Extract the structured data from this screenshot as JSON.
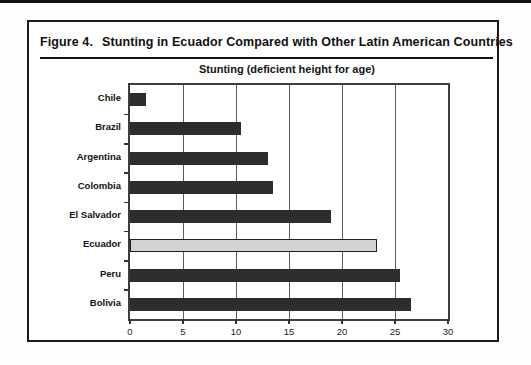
{
  "figure": {
    "title_prefix": "Figure 4.",
    "title": "Stunting in Ecuador Compared with Other Latin American Countries"
  },
  "chart_data": {
    "type": "bar",
    "orientation": "horizontal",
    "title": "Stunting (deficient height for age)",
    "categories": [
      "Chile",
      "Brazil",
      "Argentina",
      "Colombia",
      "El Salvador",
      "Ecuador",
      "Peru",
      "Bolivia"
    ],
    "values": [
      1.5,
      10.5,
      13,
      13.5,
      19,
      23.3,
      25.5,
      26.5
    ],
    "highlight_category": "Ecuador",
    "highlight_index": 5,
    "xlim": [
      0,
      30
    ],
    "x_ticks": [
      0,
      5,
      10,
      15,
      20,
      25,
      30
    ],
    "gridlines_at": [
      5,
      10,
      15,
      20,
      25
    ],
    "grid": "vertical",
    "legend": "none",
    "colors": {
      "bar": "#2d2d2d",
      "highlight_bar": "#d2d2d2",
      "plot_border": "#3d3d3d",
      "gridline": "#5c5c5c",
      "box_border": "#1a1a1a"
    }
  }
}
